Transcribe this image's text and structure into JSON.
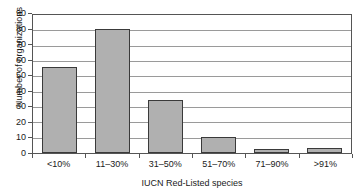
{
  "chart_data": {
    "type": "bar",
    "title": "",
    "xlabel": "IUCN Red-Listed species",
    "ylabel": "Number of organizations",
    "categories": [
      "<10%",
      "11–30%",
      "31–50%",
      "51–70%",
      "71–90%",
      ">91%"
    ],
    "values": [
      56,
      81,
      34.5,
      10.5,
      2.5,
      3.5
    ],
    "ylim": [
      0,
      90
    ],
    "yticks": [
      0,
      10,
      20,
      30,
      40,
      50,
      60,
      70,
      80,
      90
    ],
    "ytick_labels": [
      "0",
      "10",
      "20",
      "30",
      "40",
      "50",
      "60",
      "70",
      "80",
      "90"
    ],
    "grid": true,
    "legend": false,
    "bar_color": "#b0b0b0",
    "bar_edge_color": "#3a3a3a",
    "gridline_color": "#9a9a9a",
    "axis_color": "#555555"
  }
}
